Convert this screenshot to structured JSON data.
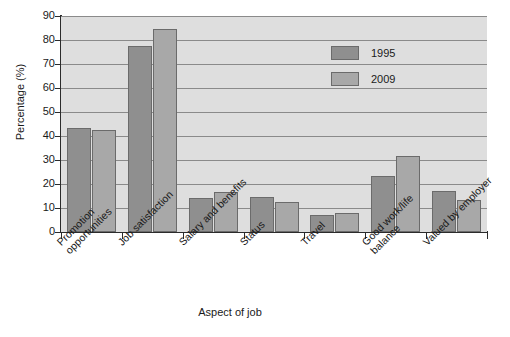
{
  "chart_data": {
    "type": "bar",
    "title": "",
    "xlabel": "Aspect of job",
    "ylabel": "Percentage (%)",
    "ylim": [
      0,
      90
    ],
    "ytick_step": 10,
    "yticks": [
      0,
      10,
      20,
      30,
      40,
      50,
      60,
      70,
      80,
      90
    ],
    "grid": "horizontal",
    "legend_position": "inside upper right",
    "categories": [
      "Promotion\nopportunities",
      "Job satisfaction",
      "Salary and benefits",
      "Status",
      "Travel",
      "Good work/life\nbalance",
      "Valued by employer"
    ],
    "series": [
      {
        "name": "1995",
        "color": "#8f8f8f",
        "values": [
          43.5,
          77.5,
          14,
          14.5,
          7,
          23.5,
          17
        ]
      },
      {
        "name": "2009",
        "color": "#a8a8a8",
        "values": [
          42.5,
          84.5,
          16.5,
          12.5,
          7.8,
          31.5,
          13.5
        ]
      }
    ]
  },
  "colors": {
    "plot_background": "#dedede",
    "gridline": "#8a8a8a",
    "axis": "#2b2b2b",
    "series_1995": "#8f8f8f",
    "series_2009": "#a8a8a8",
    "page_background": "#ffffff"
  }
}
